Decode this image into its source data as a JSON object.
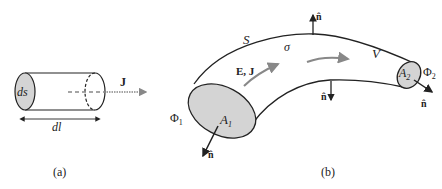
{
  "figure_a": {
    "caption": "(a)",
    "face_label": "ds",
    "length_label": "dl",
    "current_label": "J"
  },
  "figure_b": {
    "caption": "(b)",
    "surface_label": "S",
    "conductivity_label": "σ",
    "volume_label": "V",
    "field_label": "E, J",
    "area1_label": "A",
    "area1_sub": "1",
    "area2_label": "A",
    "area2_sub": "2",
    "potential1_label": "Φ",
    "potential1_sub": "1",
    "potential2_label": "Φ",
    "potential2_sub": "2",
    "normal_label": "n̂"
  },
  "colors": {
    "fill_gray": "#d4d4d4",
    "arrow_gray": "#888888",
    "line": "#222222"
  }
}
